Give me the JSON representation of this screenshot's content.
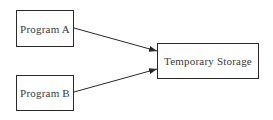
{
  "diagram": {
    "nodes": [
      {
        "id": "program_a",
        "label": "Program A"
      },
      {
        "id": "program_b",
        "label": "Program B"
      },
      {
        "id": "temporary_storage",
        "label": "Temporary Storage"
      }
    ],
    "edges": [
      {
        "from": "program_a",
        "to": "temporary_storage"
      },
      {
        "from": "program_b",
        "to": "temporary_storage"
      }
    ],
    "colors": {
      "stroke": "#2a2a2a",
      "text": "#3a3a3a",
      "background": "#ffffff"
    }
  }
}
